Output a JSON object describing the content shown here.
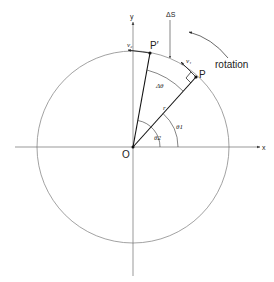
{
  "diagram": {
    "labels": {
      "x_axis": "x",
      "y_axis": "y",
      "origin": "O",
      "point_p": "P",
      "point_p_prime": "P′",
      "arc_length": "ΔS",
      "delta_theta": "Δθ",
      "theta1": "θ1",
      "theta2": "θ2",
      "radius": "r",
      "radius_prime": "r",
      "velocity_p": "v₁",
      "velocity_p_prime": "v₂",
      "rotation": "rotation"
    },
    "colors": {
      "circle": "#8a8a8a",
      "axes": "#6e6e6e",
      "radius": "#111111",
      "text": "#222222"
    }
  }
}
